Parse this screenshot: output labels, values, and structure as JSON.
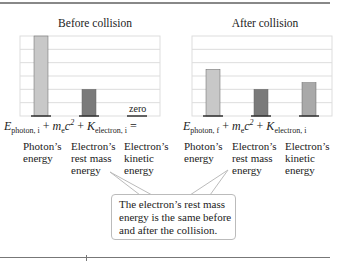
{
  "before": {
    "title": "Before collision"
  },
  "after": {
    "title": "After collision"
  },
  "zero_label": "zero",
  "equation": {
    "before_terms": [
      "E",
      "photon, i",
      "m",
      "e",
      "c",
      "2",
      "K",
      "electron, i"
    ],
    "after_terms": [
      "E",
      "photon, f",
      "m",
      "e",
      "c",
      "2",
      "K",
      "electron, i"
    ],
    "plus": "+",
    "equals": "="
  },
  "labels": {
    "photon": [
      "Photon’s",
      "energy"
    ],
    "rest": [
      "Electron’s",
      "rest mass",
      "energy"
    ],
    "kinetic": [
      "Electron’s",
      "kinetic",
      "energy"
    ]
  },
  "callout": [
    "The electron’s rest mass",
    "energy is the same before",
    "and after the collision."
  ],
  "chart_data": [
    {
      "type": "bar",
      "title": "Before collision",
      "categories": [
        "Photon’s energy",
        "Electron’s rest mass energy",
        "Electron’s kinetic energy"
      ],
      "values": [
        6,
        2,
        0
      ],
      "colors": [
        "#c8c8c8",
        "#7a7a7a",
        "#a9a9a9"
      ],
      "ylim": [
        0,
        6
      ],
      "grid": true
    },
    {
      "type": "bar",
      "title": "After collision",
      "categories": [
        "Photon’s energy",
        "Electron’s rest mass energy",
        "Electron’s kinetic energy"
      ],
      "values": [
        3.5,
        2,
        2.5
      ],
      "colors": [
        "#c8c8c8",
        "#7a7a7a",
        "#a9a9a9"
      ],
      "ylim": [
        0,
        6
      ],
      "grid": true
    }
  ]
}
